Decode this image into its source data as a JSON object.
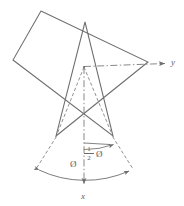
{
  "figure": {
    "background_color": "#ffffff",
    "line_color": "#6e6e6e",
    "dash_color": "#787878",
    "text_color": "#5a5a5a",
    "width": 184,
    "height": 206
  },
  "axes": {
    "y_axis": {
      "label": "y",
      "direction": "right",
      "style": "dash-dot",
      "from": [
        84,
        67
      ],
      "to": [
        168,
        64
      ]
    },
    "x_axis": {
      "label": "x",
      "direction": "down",
      "style": "dash-dot",
      "from": [
        84,
        67
      ],
      "to": [
        84,
        188
      ]
    },
    "origin": [
      84,
      67
    ]
  },
  "star": {
    "type": "pentagram",
    "points": 5,
    "stroke_width": 1,
    "vertices": [
      [
        41,
        11
      ],
      [
        148,
        62
      ],
      [
        56,
        136
      ],
      [
        85,
        22
      ],
      [
        113,
        136
      ],
      [
        13,
        60
      ]
    ],
    "path_order": [
      0,
      1,
      2,
      3,
      4,
      5,
      0
    ]
  },
  "construction": {
    "style": "dashed",
    "lines": [
      {
        "name": "origin-to-left-vertex",
        "from": [
          84,
          67
        ],
        "to": [
          56,
          136
        ]
      },
      {
        "name": "origin-to-right-vertex",
        "from": [
          84,
          67
        ],
        "to": [
          113,
          136
        ]
      },
      {
        "name": "left-vertex-extension",
        "from": [
          56,
          136
        ],
        "to": [
          34,
          172
        ]
      },
      {
        "name": "right-vertex-extension",
        "from": [
          113,
          136
        ],
        "to": [
          136,
          172
        ]
      },
      {
        "name": "half-angle-radius",
        "from": [
          84,
          142
        ],
        "to": [
          113,
          143
        ]
      }
    ]
  },
  "arcs": [
    {
      "name": "full-angle-arc",
      "label": "Ø",
      "center": [
        84,
        67
      ],
      "radius": 108,
      "start_angle_deg": 121,
      "end_angle_deg": 59,
      "arrowheads": "both"
    },
    {
      "name": "half-angle-arc",
      "label": "½Ø",
      "center": [
        84,
        67
      ],
      "radius": 76,
      "start_angle_deg": 90,
      "end_angle_deg": 66,
      "arrowheads": "both"
    }
  ],
  "labels": {
    "y_axis_label": "y",
    "x_axis_label": "x",
    "full_angle": "Ø",
    "half_angle_symbol": "Ø",
    "half_fraction_numerator": "1",
    "half_fraction_denominator": "2"
  }
}
